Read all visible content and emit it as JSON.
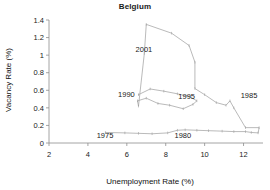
{
  "chart_data": {
    "type": "line",
    "title": "Belgium",
    "xlabel": "Unemployment Rate (%)",
    "ylabel": "Vacancy Rate (%)",
    "xlim": [
      2,
      13
    ],
    "ylim": [
      0,
      1.4
    ],
    "xticks": [
      2,
      4,
      6,
      8,
      10,
      12
    ],
    "xtick_labels": [
      "2",
      "4",
      "6",
      "8",
      "10",
      "12"
    ],
    "yticks": [
      0,
      0.2,
      0.4,
      0.6,
      0.8,
      1,
      1.2,
      1.4
    ],
    "ytick_labels": [
      "0",
      "0.2",
      "0.4",
      "0.6",
      "0.8",
      "1",
      "1.2",
      "1.4"
    ],
    "grid": false,
    "legend": "none",
    "line_color": "#a8a8a8",
    "series": [
      {
        "name": "Belgium Beveridge curve",
        "points": [
          [
            4.9,
            0.12
          ],
          [
            5.9,
            0.115
          ],
          [
            6.6,
            0.11
          ],
          [
            7.3,
            0.105
          ],
          [
            8.1,
            0.115
          ],
          [
            8.6,
            0.145
          ],
          [
            9.0,
            0.15
          ],
          [
            9.6,
            0.145
          ],
          [
            10.2,
            0.14
          ],
          [
            10.9,
            0.135
          ],
          [
            11.5,
            0.13
          ],
          [
            12.1,
            0.13
          ],
          [
            12.4,
            0.12
          ],
          [
            12.75,
            0.115
          ],
          [
            12.8,
            0.175
          ],
          [
            12.1,
            0.175
          ],
          [
            11.5,
            0.4
          ],
          [
            11.3,
            0.48
          ],
          [
            11.1,
            0.43
          ],
          [
            10.6,
            0.46
          ],
          [
            10.0,
            0.55
          ],
          [
            9.5,
            0.62
          ],
          [
            9.5,
            0.92
          ],
          [
            9.2,
            1.11
          ],
          [
            8.3,
            1.25
          ],
          [
            7.0,
            1.35
          ],
          [
            6.9,
            1.02
          ],
          [
            6.6,
            0.42
          ],
          [
            6.55,
            0.48
          ],
          [
            7.0,
            0.51
          ],
          [
            7.6,
            0.45
          ],
          [
            8.2,
            0.43
          ],
          [
            8.9,
            0.39
          ],
          [
            9.4,
            0.44
          ],
          [
            9.6,
            0.48
          ],
          [
            9.2,
            0.53
          ],
          [
            8.6,
            0.56
          ],
          [
            7.9,
            0.59
          ],
          [
            7.2,
            0.615
          ],
          [
            6.6,
            0.55
          ]
        ]
      }
    ],
    "annotations": [
      {
        "text": "2001",
        "x": 6.45,
        "y": 1.04
      },
      {
        "text": "1990",
        "x": 5.55,
        "y": 0.525
      },
      {
        "text": "1995",
        "x": 8.65,
        "y": 0.505
      },
      {
        "text": "1985",
        "x": 11.85,
        "y": 0.51
      },
      {
        "text": "1975",
        "x": 4.45,
        "y": 0.055
      },
      {
        "text": "1980",
        "x": 8.45,
        "y": 0.055
      }
    ]
  }
}
